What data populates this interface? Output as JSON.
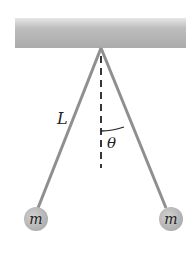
{
  "diagram": {
    "type": "double-pendulum-sketch",
    "labels": {
      "length": "L",
      "angle": "θ",
      "mass_left": "m",
      "mass_right": "m"
    },
    "colors": {
      "ceiling": "#b8b8b8",
      "string": "#8f8f8f",
      "mass": "#b5b5b5",
      "dashed_line": "#222222",
      "text": "#222222"
    }
  }
}
